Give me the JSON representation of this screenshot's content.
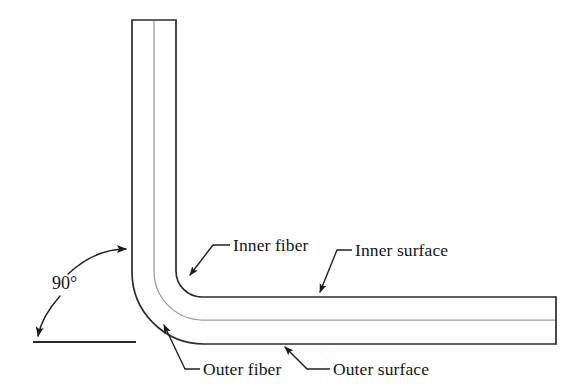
{
  "figure": {
    "kind": "engineering-diagram",
    "background_color": "#ffffff",
    "line_color": "#2b2b2b",
    "centerline_color": "#9a9a9a",
    "text_color": "#141414"
  },
  "annotations": {
    "angle": {
      "label": "90°",
      "x": 52,
      "y": 289
    },
    "inner_fiber": {
      "label": "Inner fiber",
      "x": 233,
      "y": 251
    },
    "inner_surface": {
      "label": "Inner surface",
      "x": 355,
      "y": 256
    },
    "outer_fiber": {
      "label": "Outer fiber",
      "x": 203,
      "y": 375
    },
    "outer_surface": {
      "label": "Outer surface",
      "x": 333,
      "y": 375
    }
  },
  "geometry": {
    "vertical_arm": {
      "left_x": 132,
      "right_x": 176,
      "top_y": 20,
      "center_x": 154
    },
    "horizontal_arm": {
      "top_y": 297,
      "bottom_y": 344,
      "right_x": 556,
      "center_y": 320
    },
    "bend": {
      "angle_degrees": 90,
      "inner_radius": 26,
      "center_radius": 49,
      "outer_radius": 72
    },
    "reference_line": {
      "x1": 33,
      "x2": 136,
      "y": 342
    }
  }
}
